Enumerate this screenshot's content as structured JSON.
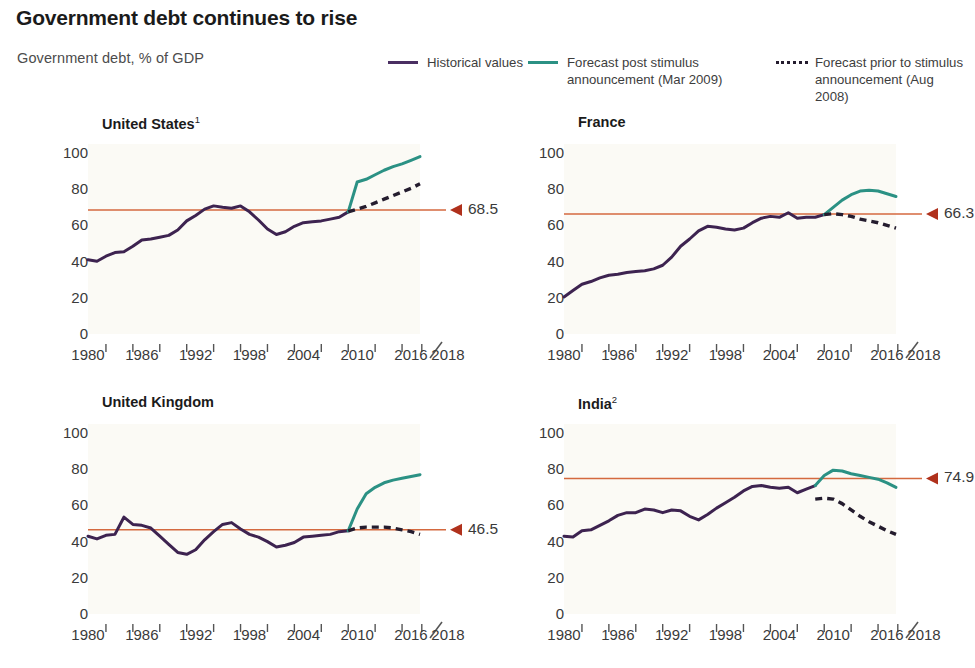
{
  "header": {
    "title": "Government debt continues to rise",
    "subtitle": "Government debt, % of GDP"
  },
  "legend": {
    "items": [
      {
        "label": "Historical values",
        "style": "solid",
        "color": "#4a2f62",
        "icon": "line-swatch-icon"
      },
      {
        "label": "Forecast post stimulus\nannouncement (Mar 2009)",
        "style": "solid",
        "color": "#2b9184",
        "icon": "line-swatch-icon"
      },
      {
        "label": "Forecast prior to stimulus\nannouncement (Aug 2008)",
        "style": "dashed",
        "color": "#241c2e",
        "icon": "dashed-line-swatch-icon"
      }
    ]
  },
  "colors": {
    "historical": "#3d2350",
    "forecast_post": "#2b9184",
    "forecast_prior": "#241c2e",
    "reference_line": "#d4693f",
    "marker": "#b0311c",
    "plot_background": "#fbfaf5",
    "text": "#3a3a3a",
    "title": "#1b1b1b"
  },
  "axes": {
    "y_ticks": [
      100,
      80,
      60,
      40,
      20,
      0
    ],
    "y_min": 0,
    "y_max": 105,
    "x_labels": [
      "1980",
      "1986",
      "1992",
      "1998",
      "2004",
      "2010",
      "2016",
      "2018"
    ],
    "x_min": 1980,
    "x_max": 2017,
    "x_break_before": "2018",
    "x_minor_tick_years": [
      1982,
      1985,
      1988,
      1991,
      1994,
      1997,
      2000,
      2003,
      2006,
      2009,
      2012,
      2015
    ],
    "grid": false
  },
  "chart_data": [
    {
      "type": "line",
      "title": "United States",
      "title_superscript": "1",
      "xlabel": "",
      "ylabel": "Government debt, % of GDP",
      "ylim": [
        0,
        105
      ],
      "xlim": [
        1980,
        2017
      ],
      "reference_value": 68.5,
      "reference_label": "68.5",
      "series": [
        {
          "name": "Historical values",
          "color": "#3d2350",
          "style": "solid",
          "x": [
            1980,
            1981,
            1982,
            1983,
            1984,
            1985,
            1986,
            1987,
            1988,
            1989,
            1990,
            1991,
            1992,
            1993,
            1994,
            1995,
            1996,
            1997,
            1998,
            1999,
            2000,
            2001,
            2002,
            2003,
            2004,
            2005,
            2006,
            2007,
            2008,
            2009
          ],
          "values": [
            41.0,
            40.2,
            43.0,
            45.0,
            45.5,
            48.5,
            52.0,
            52.5,
            53.5,
            54.5,
            57.5,
            62.5,
            65.5,
            69.0,
            70.8,
            70.0,
            69.5,
            70.8,
            67.5,
            63.0,
            58.0,
            55.0,
            56.5,
            59.5,
            61.5,
            62.0,
            62.5,
            63.5,
            64.5,
            67.5
          ]
        },
        {
          "name": "Forecast post stimulus announcement (Mar 2009)",
          "color": "#2b9184",
          "style": "solid",
          "x": [
            2009,
            2010,
            2011,
            2012,
            2013,
            2014,
            2015,
            2016,
            2017
          ],
          "values": [
            67.5,
            84.0,
            85.5,
            88.0,
            90.5,
            92.5,
            94.0,
            96.0,
            98.0
          ]
        },
        {
          "name": "Forecast prior to stimulus announcement (Aug 2008)",
          "color": "#241c2e",
          "style": "dashed",
          "x": [
            2009,
            2010,
            2011,
            2012,
            2013,
            2014,
            2015,
            2016,
            2017
          ],
          "values": [
            67.5,
            69.0,
            70.5,
            72.5,
            74.5,
            76.5,
            78.5,
            80.5,
            83.0
          ]
        }
      ]
    },
    {
      "type": "line",
      "title": "France",
      "title_superscript": "",
      "xlabel": "",
      "ylabel": "Government debt, % of GDP",
      "ylim": [
        0,
        105
      ],
      "xlim": [
        1980,
        2017
      ],
      "reference_value": 66.3,
      "reference_label": "66.3",
      "series": [
        {
          "name": "Historical values",
          "color": "#3d2350",
          "style": "solid",
          "x": [
            1980,
            1981,
            1982,
            1983,
            1984,
            1985,
            1986,
            1987,
            1988,
            1989,
            1990,
            1991,
            1992,
            1993,
            1994,
            1995,
            1996,
            1997,
            1998,
            1999,
            2000,
            2001,
            2002,
            2003,
            2004,
            2005,
            2006,
            2007,
            2008,
            2009
          ],
          "values": [
            20.5,
            24.0,
            27.5,
            29.0,
            31.0,
            32.5,
            33.0,
            34.0,
            34.5,
            35.0,
            36.0,
            38.0,
            42.5,
            48.5,
            52.5,
            57.0,
            59.5,
            59.0,
            58.0,
            57.5,
            58.5,
            61.5,
            64.0,
            65.0,
            64.5,
            67.0,
            64.0,
            64.5,
            64.5,
            66.0
          ]
        },
        {
          "name": "Forecast post stimulus announcement (Mar 2009)",
          "color": "#2b9184",
          "style": "solid",
          "x": [
            2009,
            2010,
            2011,
            2012,
            2013,
            2014,
            2015,
            2016,
            2017
          ],
          "values": [
            66.0,
            70.0,
            74.0,
            77.0,
            79.0,
            79.5,
            79.0,
            77.5,
            76.0
          ]
        },
        {
          "name": "Forecast prior to stimulus announcement (Aug 2008)",
          "color": "#241c2e",
          "style": "dashed",
          "x": [
            2009,
            2010,
            2011,
            2012,
            2013,
            2014,
            2015,
            2016,
            2017
          ],
          "values": [
            66.0,
            66.5,
            66.0,
            65.0,
            63.5,
            62.5,
            61.5,
            60.0,
            58.5
          ]
        }
      ]
    },
    {
      "type": "line",
      "title": "United Kingdom",
      "title_superscript": "",
      "xlabel": "",
      "ylabel": "Government debt, % of GDP",
      "ylim": [
        0,
        105
      ],
      "xlim": [
        1980,
        2017
      ],
      "reference_value": 46.5,
      "reference_label": "46.5",
      "series": [
        {
          "name": "Historical values",
          "color": "#3d2350",
          "style": "solid",
          "x": [
            1980,
            1981,
            1982,
            1983,
            1984,
            1985,
            1986,
            1987,
            1988,
            1989,
            1990,
            1991,
            1992,
            1993,
            1994,
            1995,
            1996,
            1997,
            1998,
            1999,
            2000,
            2001,
            2002,
            2003,
            2004,
            2005,
            2006,
            2007,
            2008,
            2009
          ],
          "values": [
            43.0,
            41.5,
            43.5,
            44.0,
            53.5,
            49.5,
            49.0,
            47.5,
            43.0,
            38.5,
            34.0,
            33.0,
            35.5,
            41.0,
            45.5,
            49.5,
            50.5,
            47.0,
            44.0,
            42.5,
            40.0,
            37.0,
            38.0,
            39.5,
            42.5,
            43.0,
            43.5,
            44.0,
            45.5,
            46.0
          ]
        },
        {
          "name": "Forecast post stimulus announcement (Mar 2009)",
          "color": "#2b9184",
          "style": "solid",
          "x": [
            2009,
            2010,
            2011,
            2012,
            2013,
            2014,
            2015,
            2016,
            2017
          ],
          "values": [
            46.0,
            58.0,
            66.5,
            70.0,
            72.5,
            74.0,
            75.0,
            76.0,
            77.0
          ]
        },
        {
          "name": "Forecast prior to stimulus announcement (Aug 2008)",
          "color": "#241c2e",
          "style": "dashed",
          "x": [
            2009,
            2010,
            2011,
            2012,
            2013,
            2014,
            2015,
            2016,
            2017
          ],
          "values": [
            46.0,
            47.5,
            48.0,
            48.0,
            48.0,
            47.5,
            46.5,
            45.5,
            44.0
          ]
        }
      ]
    },
    {
      "type": "line",
      "title": "India",
      "title_superscript": "2",
      "xlabel": "",
      "ylabel": "Government debt, % of GDP",
      "ylim": [
        0,
        105
      ],
      "xlim": [
        1980,
        2017
      ],
      "reference_value": 74.9,
      "reference_label": "74.9",
      "series": [
        {
          "name": "Historical values",
          "color": "#3d2350",
          "style": "solid",
          "x": [
            1980,
            1981,
            1982,
            1983,
            1984,
            1985,
            1986,
            1987,
            1988,
            1989,
            1990,
            1991,
            1992,
            1993,
            1994,
            1995,
            1996,
            1997,
            1998,
            1999,
            2000,
            2001,
            2002,
            2003,
            2004,
            2005,
            2006,
            2007,
            2008
          ],
          "values": [
            43.0,
            42.5,
            46.0,
            46.5,
            49.0,
            51.5,
            54.5,
            56.0,
            56.0,
            58.0,
            57.5,
            56.0,
            57.5,
            57.0,
            54.0,
            52.0,
            55.0,
            58.5,
            61.5,
            64.5,
            68.0,
            70.5,
            71.0,
            70.0,
            69.5,
            70.0,
            67.0,
            69.0,
            71.0
          ]
        },
        {
          "name": "Forecast post stimulus announcement (Mar 2009)",
          "color": "#2b9184",
          "style": "solid",
          "x": [
            2008,
            2009,
            2010,
            2011,
            2012,
            2013,
            2014,
            2015,
            2016,
            2017
          ],
          "values": [
            71.0,
            76.5,
            79.5,
            79.0,
            77.5,
            76.5,
            75.5,
            74.5,
            72.5,
            70.0
          ]
        },
        {
          "name": "Forecast prior to stimulus announcement (Aug 2008)",
          "color": "#241c2e",
          "style": "dashed",
          "x": [
            2008,
            2009,
            2010,
            2011,
            2012,
            2013,
            2014,
            2015,
            2016,
            2017
          ],
          "values": [
            63.5,
            64.0,
            63.5,
            61.0,
            57.5,
            54.0,
            51.0,
            48.5,
            46.0,
            44.0
          ]
        }
      ]
    }
  ]
}
